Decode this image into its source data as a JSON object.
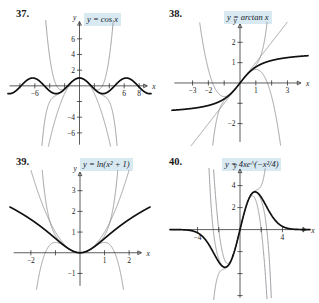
{
  "page": {
    "kind": "textbook-exercise-figures",
    "figure_count": 4
  },
  "figures": [
    {
      "number": "37.",
      "equation_label": "y = cos x",
      "function": "cos x",
      "axis_labels": {
        "x": "x",
        "y": "y"
      },
      "x_ticks": [
        "-6",
        "6",
        "8"
      ],
      "y_ticks": [
        "6",
        "4",
        "2",
        "-4",
        "-6"
      ],
      "chart_data": {
        "type": "line",
        "title": "y = cos x",
        "xlabel": "x",
        "ylabel": "y",
        "xlim": [
          -9,
          9
        ],
        "ylim": [
          -7.5,
          7.5
        ],
        "x_tick_values": [
          -6,
          6,
          8
        ],
        "y_tick_values": [
          6,
          4,
          2,
          -4,
          -6
        ],
        "grid": false,
        "legend": "none",
        "series": [
          {
            "name": "y = cos x",
            "style": "thick-black",
            "expression": "cos(x)"
          },
          {
            "name": "Taylor polynomial degree 2",
            "style": "thin-gray",
            "expression": "1 - x^2/2"
          },
          {
            "name": "Taylor polynomial degree 4",
            "style": "thin-gray",
            "expression": "1 - x^2/2 + x^4/24"
          },
          {
            "name": "Taylor polynomial degree 6",
            "style": "thin-gray",
            "expression": "1 - x^2/2 + x^4/24 - x^6/720"
          }
        ]
      }
    },
    {
      "number": "38.",
      "equation_label": "y = arctan x",
      "function": "arctan x",
      "axis_labels": {
        "x": "x",
        "y": "y"
      },
      "x_ticks": [
        "-3",
        "-2",
        "1",
        "3"
      ],
      "y_ticks": [
        "2",
        "1",
        "-2"
      ],
      "chart_data": {
        "type": "line",
        "title": "y = arctan x",
        "xlabel": "x",
        "ylabel": "y",
        "xlim": [
          -4,
          4
        ],
        "ylim": [
          -3,
          3
        ],
        "x_tick_values": [
          -3,
          -2,
          -1,
          1,
          2,
          3
        ],
        "y_tick_values": [
          2,
          1,
          -1,
          -2
        ],
        "grid": false,
        "legend": "none",
        "series": [
          {
            "name": "y = arctan x",
            "style": "thick-black",
            "expression": "arctan(x)"
          },
          {
            "name": "Taylor polynomial degree 1",
            "style": "thin-gray",
            "expression": "x"
          },
          {
            "name": "Taylor polynomial degree 3",
            "style": "thin-gray",
            "expression": "x - x^3/3"
          },
          {
            "name": "Taylor polynomial degree 5",
            "style": "thin-gray",
            "expression": "x - x^3/3 + x^5/5"
          }
        ]
      }
    },
    {
      "number": "39.",
      "equation_label": "y = ln(x² + 1)",
      "function": "ln(x^2 + 1)",
      "axis_labels": {
        "x": "x",
        "y": "y"
      },
      "x_ticks": [
        "-2",
        "1",
        "2"
      ],
      "y_ticks": [
        "3",
        "2",
        "1",
        "-1"
      ],
      "chart_data": {
        "type": "line",
        "title": "y = ln(x^2 + 1)",
        "xlabel": "x",
        "ylabel": "y",
        "xlim": [
          -2.7,
          2.7
        ],
        "ylim": [
          -1.7,
          3.8
        ],
        "x_tick_values": [
          -2,
          -1,
          1,
          2
        ],
        "y_tick_values": [
          3,
          2,
          1,
          -1
        ],
        "grid": false,
        "legend": "none",
        "series": [
          {
            "name": "y = ln(x^2 + 1)",
            "style": "thick-black",
            "expression": "ln(x^2+1)"
          },
          {
            "name": "Taylor polynomial degree 2",
            "style": "thin-gray",
            "expression": "x^2"
          },
          {
            "name": "Taylor polynomial degree 4",
            "style": "thin-gray",
            "expression": "x^2 - x^4/2"
          },
          {
            "name": "Taylor polynomial degree 6",
            "style": "thin-gray",
            "expression": "x^2 - x^4/2 + x^6/3"
          }
        ]
      }
    },
    {
      "number": "40.",
      "equation_label": "y = 4xe^(−x²/4)",
      "function": "4x e^(-x^2/4)",
      "axis_labels": {
        "x": "x",
        "y": "y"
      },
      "x_ticks": [
        "-4",
        "4"
      ],
      "y_ticks": [
        "4",
        "2"
      ],
      "chart_data": {
        "type": "line",
        "title": "y = 4xe^(-x^2/4)",
        "xlabel": "x",
        "ylabel": "y",
        "xlim": [
          -6,
          6.5
        ],
        "ylim": [
          -6,
          5.2
        ],
        "x_tick_values": [
          -4,
          -2,
          2,
          4
        ],
        "y_tick_values": [
          4,
          2,
          -2,
          -4
        ],
        "grid": false,
        "legend": "none",
        "series": [
          {
            "name": "y = 4xe^(-x^2/4)",
            "style": "thick-black",
            "expression": "4x*exp(-x^2/4)"
          },
          {
            "name": "Taylor polynomial degree 3",
            "style": "thin-gray",
            "expression": "4x - x^3"
          },
          {
            "name": "Taylor polynomial degree 5",
            "style": "thin-gray",
            "expression": "4x - x^3 + x^5/8"
          },
          {
            "name": "Taylor polynomial degree 7",
            "style": "thin-gray",
            "expression": "4x - x^3 + x^5/8 - x^7/96"
          }
        ]
      }
    }
  ]
}
